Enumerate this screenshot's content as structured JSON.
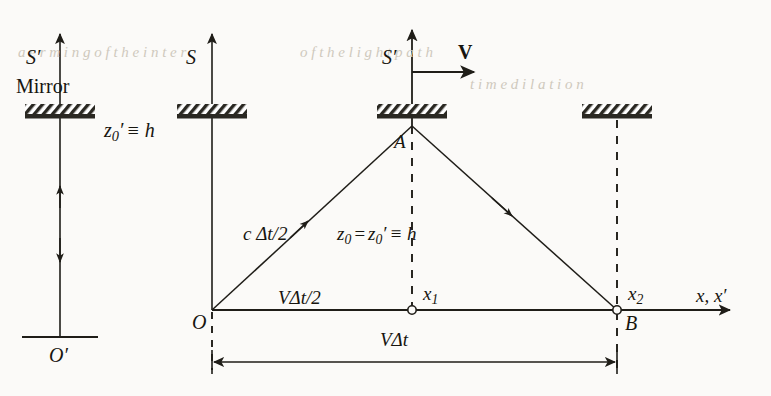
{
  "figure": {
    "type": "physics-diagram"
  },
  "left_panel": {
    "frame_label": "S′",
    "mirror_caption": "Mirror",
    "height_label_main": "z",
    "height_label_sub": "0",
    "height_label_prime": "′",
    "height_label_rest": "≡ h",
    "origin_label": "O′"
  },
  "main_panel": {
    "frame_s_label": "S",
    "frame_s_prime_label": "S′",
    "velocity_label": "V",
    "apex_label": "A",
    "origin_label": "O",
    "end_label": "B",
    "x1_label_main": "x",
    "x1_label_sub": "1",
    "x2_label_main": "x",
    "x2_label_sub": "2",
    "axis_label": "x, x′",
    "ray_label": "c Δt/2",
    "height_label_z0": "z",
    "height_label_z0_sub": "0",
    "height_label_eq": "=",
    "height_label_z0p": "z",
    "height_label_z0p_sub": "0",
    "height_label_prime": "′",
    "height_label_ident": "≡ h",
    "half_base_label": "VΔt/2",
    "full_base_label": "VΔt"
  },
  "colors": {
    "ink": "#17150f",
    "line": "#1f1d18",
    "mirror_fill": "#2a2822",
    "paper": "#fbfaf8",
    "ghost": "#cfc9bd"
  },
  "geometry": {
    "left_axis_x": 60,
    "left_mirror_y": 118,
    "left_base_y": 337,
    "s_axis_x": 212,
    "s_prime_axis_x": 412,
    "mirror_y": 118,
    "apex_y": 126,
    "baseline_y": 310,
    "origin_x": 212,
    "x1_x": 412,
    "x2_x": 617,
    "right_mirror_x": 617,
    "dim_line_y": 362
  },
  "bleed_text": {
    "note": "faint show-through text from reverse page",
    "lines": [
      "a e r m i n g  o f  t h e   i n t e r",
      "o f  t h e   l i g h t   p a t h",
      "t i m e   d i l a t i o n"
    ]
  }
}
